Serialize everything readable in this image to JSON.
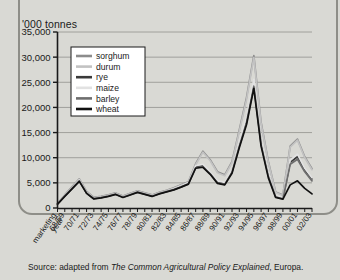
{
  "figure": {
    "y_axis_title": "'000 tonnes",
    "source_prefix": "Source: adapted from ",
    "source_title": "The Common Agricultural Policy Explained",
    "source_suffix": ", Europa.",
    "x_axis_corner_line1": "marketing",
    "x_axis_corner_line2": "year"
  },
  "chart_data": {
    "type": "line",
    "title": "",
    "xlabel": "marketing year",
    "ylabel": "'000 tonnes",
    "ylim": [
      0,
      35000
    ],
    "yticks": [
      0,
      5000,
      10000,
      15000,
      20000,
      25000,
      30000,
      35000
    ],
    "ytick_labels": [
      "0",
      "5,000",
      "10,000",
      "15,000",
      "20,000",
      "25,000",
      "30,000",
      "35,000"
    ],
    "grid": true,
    "legend_position": "upper-left-inside",
    "x": [
      "67/68",
      "68/69",
      "69/70",
      "70/71",
      "71/72",
      "72/73",
      "73/74",
      "74/75",
      "75/76",
      "76/77",
      "77/78",
      "78/79",
      "79/80",
      "80/81",
      "81/82",
      "82/83",
      "83/84",
      "84/85",
      "85/86",
      "86/87",
      "87/88",
      "88/89",
      "89/90",
      "90/91",
      "91/92",
      "92/93",
      "93/94",
      "94/95",
      "95/96",
      "96/97",
      "97/98",
      "98/99",
      "99/00",
      "00/01",
      "01/02",
      "02/03"
    ],
    "xtick_labels": [
      "68/69",
      "70/71",
      "72/73",
      "74/75",
      "76/77",
      "78/79",
      "80/81",
      "82/83",
      "84/85",
      "86/87",
      "88/89",
      "90/91",
      "92/93",
      "94/95",
      "96/97",
      "98/99",
      "00/01",
      "02/03"
    ],
    "series": [
      {
        "name": "sorghum",
        "color": "#8c8c8c",
        "values": [
          900,
          2600,
          4200,
          5800,
          3300,
          2100,
          2300,
          2600,
          3000,
          2400,
          2900,
          3400,
          3000,
          2600,
          3100,
          3500,
          4000,
          4600,
          5200,
          8800,
          11300,
          9600,
          7200,
          6600,
          9200,
          15500,
          22000,
          30300,
          17000,
          9200,
          3200,
          2600,
          12300,
          13700,
          10200,
          7800
        ]
      },
      {
        "name": "durum",
        "color": "#c2c2c2",
        "values": [
          850,
          2500,
          4100,
          5700,
          3200,
          2000,
          2200,
          2500,
          2900,
          2300,
          2800,
          3300,
          2900,
          2500,
          3000,
          3400,
          3900,
          4500,
          5100,
          8600,
          11100,
          9400,
          7000,
          6400,
          9000,
          15200,
          21600,
          29900,
          16700,
          9000,
          3100,
          2500,
          12100,
          13500,
          10000,
          7600
        ]
      },
      {
        "name": "rye",
        "color": "#3a3a3a",
        "values": [
          800,
          2400,
          3900,
          5500,
          3000,
          1900,
          2100,
          2400,
          2800,
          2200,
          2700,
          3200,
          2800,
          2400,
          2900,
          3300,
          3700,
          4300,
          4900,
          8200,
          8400,
          7000,
          5200,
          4900,
          7300,
          12600,
          17500,
          24800,
          13000,
          6600,
          2300,
          1900,
          9100,
          10200,
          7600,
          5800
        ]
      },
      {
        "name": "maize",
        "color": "#e2e2e2",
        "values": [
          820,
          2450,
          3950,
          5600,
          3050,
          1950,
          2150,
          2450,
          2850,
          2250,
          2750,
          3250,
          2850,
          2450,
          2950,
          3350,
          3800,
          4400,
          5000,
          8400,
          8700,
          7200,
          5400,
          5100,
          7600,
          13000,
          18100,
          25600,
          13500,
          6900,
          2400,
          2000,
          9500,
          10700,
          7900,
          6000
        ]
      },
      {
        "name": "barley",
        "color": "#6e6e6e",
        "values": [
          780,
          2350,
          3850,
          5400,
          2950,
          1850,
          2050,
          2350,
          2750,
          2150,
          2650,
          3150,
          2750,
          2350,
          2850,
          3250,
          3650,
          4200,
          4800,
          8000,
          8200,
          6800,
          5000,
          4700,
          7100,
          12300,
          17000,
          24200,
          12600,
          6300,
          2200,
          1800,
          8700,
          9700,
          7200,
          5400
        ]
      },
      {
        "name": "wheat",
        "color": "#111111",
        "values": [
          760,
          2300,
          3800,
          5300,
          2900,
          1800,
          2000,
          2300,
          2700,
          2100,
          2600,
          3100,
          2700,
          2300,
          2800,
          3200,
          3600,
          4150,
          4750,
          7900,
          8100,
          6700,
          4900,
          4600,
          6900,
          12000,
          16600,
          23800,
          12300,
          6000,
          2100,
          1750,
          4600,
          5400,
          3900,
          2800
        ]
      }
    ]
  }
}
